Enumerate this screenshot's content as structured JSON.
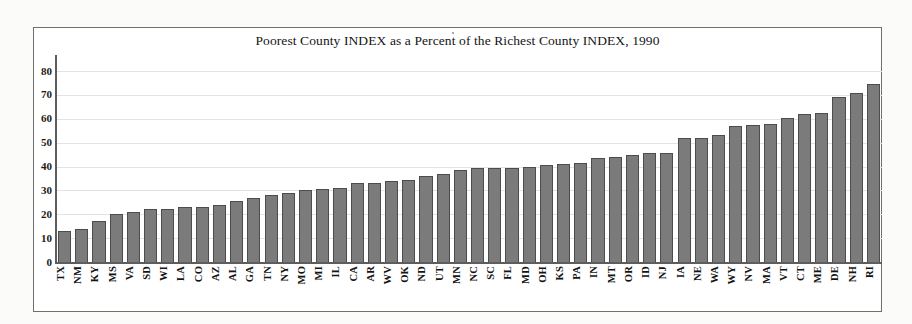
{
  "chart_data": {
    "type": "bar",
    "title": "Poorest County INDEX as a Percent of the Richest County INDEX, 1990",
    "xlabel": "",
    "ylabel": "",
    "ylim": [
      0,
      85
    ],
    "yticks": [
      0,
      10,
      20,
      30,
      40,
      50,
      60,
      70,
      80
    ],
    "ytick_labels": [
      "0",
      "10",
      "20",
      "30",
      "40",
      "50",
      "60",
      "70",
      "80"
    ],
    "grid": true,
    "legend": null,
    "bar_color": "#7b7b7b",
    "bar_edge_color": "#4c4c4c",
    "categories": [
      "TX",
      "NM",
      "KY",
      "MS",
      "VA",
      "SD",
      "WI",
      "LA",
      "CO",
      "AZ",
      "AL",
      "GA",
      "TN",
      "NY",
      "MO",
      "MI",
      "IL",
      "CA",
      "AR",
      "WV",
      "OK",
      "ND",
      "UT",
      "MN",
      "NC",
      "SC",
      "FL",
      "MD",
      "OH",
      "KS",
      "PA",
      "IN",
      "MT",
      "OR",
      "ID",
      "NJ",
      "IA",
      "NE",
      "WA",
      "WY",
      "NV",
      "MA",
      "VT",
      "CT",
      "ME",
      "DE",
      "NH",
      "RI"
    ],
    "values": [
      13,
      14,
      17,
      20,
      21,
      22,
      22,
      23,
      23,
      24,
      25.5,
      27,
      28,
      29,
      30,
      30.5,
      31,
      33,
      33,
      34,
      34.5,
      36,
      37,
      38.5,
      39.5,
      39.5,
      39.5,
      40,
      40.5,
      41,
      41.5,
      43.5,
      44,
      45,
      45.5,
      45.5,
      52,
      52,
      53,
      57,
      57.5,
      58,
      60.5,
      62,
      62.5,
      69,
      71,
      74.5
    ]
  }
}
